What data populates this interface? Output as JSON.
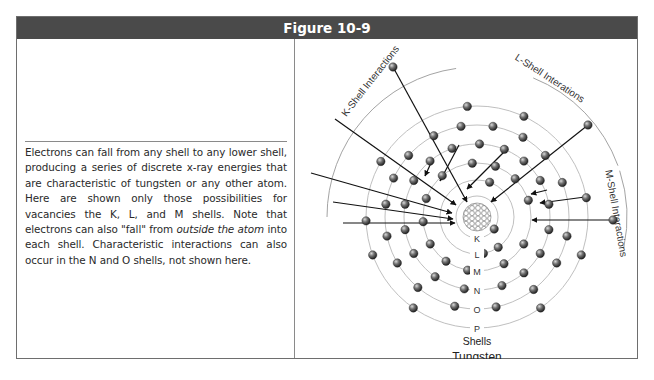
{
  "figure": {
    "title": "Figure 10-9",
    "caption_parts": [
      "Electrons can fall from any shell to any lower shell, producing a series of discrete x-ray energies that are characteristic of tungsten or any other atom. Here are shown only those possibilities for vacancies the K, L, and M shells. Note that electrons can also \"fall\" from ",
      "outside the atom",
      " into each shell. Characteristic interactions can also occur in the N and O shells, not shown here."
    ]
  },
  "diagram": {
    "element": "Tungsten",
    "shells_label": "Shells",
    "nucleus": {
      "cx": 182,
      "cy": 178,
      "r": 14
    },
    "shells": [
      {
        "label": "K",
        "r": 21
      },
      {
        "label": "L",
        "r": 37
      },
      {
        "label": "M",
        "r": 54
      },
      {
        "label": "N",
        "r": 73
      },
      {
        "label": "O",
        "r": 92
      },
      {
        "label": "P",
        "r": 111
      }
    ],
    "interaction_labels": [
      {
        "text": "K-Shell Interactions",
        "x": 78,
        "y": 44,
        "rotate": -52
      },
      {
        "text": "L-Shell Interations",
        "x": 253,
        "y": 42,
        "rotate": 33
      },
      {
        "text": "M-Shell Interactions",
        "x": 318,
        "y": 175,
        "rotate": 80
      }
    ],
    "colors": {
      "shell_line": "#b8b8b8",
      "electron": "#555555",
      "arrow": "#111111",
      "header_bg": "#4a4a4a"
    }
  }
}
